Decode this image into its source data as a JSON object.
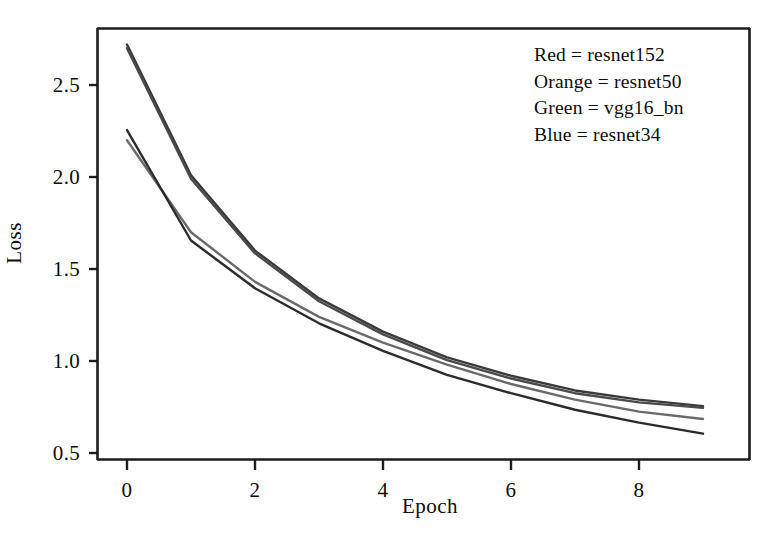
{
  "chart_data": {
    "type": "line",
    "title": "",
    "xlabel": "Epoch",
    "ylabel": "Loss",
    "xlim": [
      -0.25,
      9.6
    ],
    "ylim": [
      0.42,
      2.86
    ],
    "xticks": [
      0,
      2,
      4,
      6,
      8
    ],
    "xtick_labels": [
      "0",
      "2",
      "4",
      "6",
      "8"
    ],
    "yticks": [
      0.5,
      1.0,
      1.5,
      2.0,
      2.5
    ],
    "ytick_labels": [
      "0.5",
      "1.0",
      "1.5",
      "2.0",
      "2.5"
    ],
    "grid": false,
    "legend_position": "upper right",
    "x": [
      0,
      1,
      2,
      3,
      4,
      5,
      6,
      7,
      8,
      9
    ],
    "series": [
      {
        "name": "resnet152",
        "legend_label": "Red = resnet152",
        "color_name": "Red",
        "color": "#3a3a3a",
        "values": [
          2.72,
          2.01,
          1.6,
          1.34,
          1.16,
          1.02,
          0.92,
          0.84,
          0.79,
          0.755
        ]
      },
      {
        "name": "resnet50",
        "legend_label": "Orange = resnet50",
        "color_name": "Orange",
        "color": "#4a4a4a",
        "values": [
          2.7,
          1.99,
          1.585,
          1.325,
          1.145,
          1.005,
          0.905,
          0.825,
          0.775,
          0.745
        ]
      },
      {
        "name": "vgg16_bn",
        "legend_label": "Green = vgg16_bn",
        "color_name": "Green",
        "color": "#6a6a6a",
        "values": [
          2.2,
          1.7,
          1.43,
          1.24,
          1.1,
          0.98,
          0.875,
          0.79,
          0.725,
          0.685
        ]
      },
      {
        "name": "resnet34",
        "legend_label": "Blue = resnet34",
        "color_name": "Blue",
        "color": "#2b2b2b",
        "values": [
          2.255,
          1.655,
          1.395,
          1.205,
          1.055,
          0.925,
          0.825,
          0.735,
          0.665,
          0.605
        ]
      }
    ]
  },
  "legend": {
    "lines": [
      "Red = resnet152",
      "Orange = resnet50",
      "Green = vgg16_bn",
      "Blue = resnet34"
    ]
  },
  "axes": {
    "x_title": "Epoch",
    "y_title": "Loss"
  },
  "style": {
    "frame_color": "#1a1a1a",
    "background": "#ffffff",
    "text_color": "#0d0d0d"
  }
}
